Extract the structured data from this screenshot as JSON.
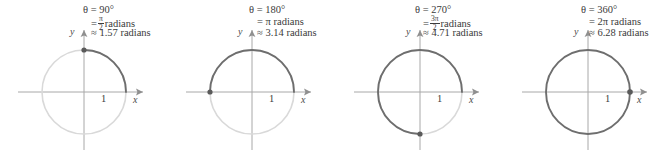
{
  "figure": {
    "colors": {
      "arc_dark": "#6e6e6e",
      "circle_light": "#d9d9d9",
      "axis": "#a8a8a8",
      "text": "#3b3b3b",
      "dot": "#5a5a5a",
      "background": "#ffffff"
    },
    "geometry": {
      "center_x": 84,
      "center_y": 92,
      "radius": 42
    }
  },
  "panels": [
    {
      "id": "panel-90",
      "theta_degrees": "θ = 90°",
      "radians_exact_prefix": "=",
      "radians_exact_num": "π",
      "radians_exact_den": "2",
      "radians_exact_unit": "radians",
      "radians_approx": "≈ 1.57 radians",
      "arc_start_deg": 0,
      "arc_end_deg": 90,
      "dot_angle_deg": 90,
      "x_axis_label": "x",
      "y_axis_label": "y",
      "radius_label": "1"
    },
    {
      "id": "panel-180",
      "theta_degrees": "θ = 180°",
      "radians_exact_prefix": "=",
      "radians_exact_plain": "π radians",
      "radians_approx": "≈ 3.14 radians",
      "arc_start_deg": 0,
      "arc_end_deg": 180,
      "dot_angle_deg": 180,
      "x_axis_label": "x",
      "y_axis_label": "y",
      "radius_label": "1"
    },
    {
      "id": "panel-270",
      "theta_degrees": "θ = 270°",
      "radians_exact_prefix": "=",
      "radians_exact_num": "3π",
      "radians_exact_den": "2",
      "radians_exact_unit": "radians",
      "radians_approx": "≈ 4.71 radians",
      "arc_start_deg": 0,
      "arc_end_deg": 270,
      "dot_angle_deg": 270,
      "x_axis_label": "x",
      "y_axis_label": "y",
      "radius_label": "1"
    },
    {
      "id": "panel-360",
      "theta_degrees": "θ = 360°",
      "radians_exact_prefix": "=",
      "radians_exact_plain": "2π radians",
      "radians_approx": "≈ 6.28 radians",
      "arc_start_deg": 0,
      "arc_end_deg": 360,
      "dot_angle_deg": 0,
      "x_axis_label": "x",
      "y_axis_label": "y",
      "radius_label": "1"
    }
  ]
}
